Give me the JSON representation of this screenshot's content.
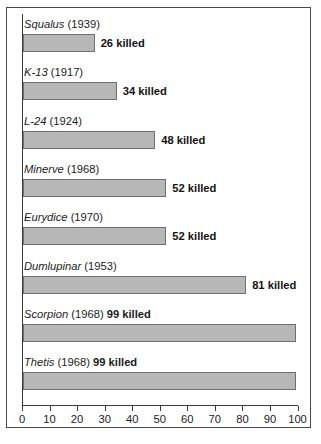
{
  "chart_data": {
    "type": "bar",
    "orientation": "horizontal",
    "title": "",
    "xlabel": "",
    "ylabel": "",
    "xlim": [
      0,
      100
    ],
    "grid": false,
    "legend": null,
    "value_suffix": "killed",
    "categories": [
      "Squalus (1939)",
      "K-13 (1917)",
      "L-24 (1924)",
      "Minerve (1968)",
      "Eurydice (1970)",
      "Dumlupinar (1953)",
      "Scorpion (1968)",
      "Thetis (1968)"
    ],
    "values": [
      26,
      34,
      48,
      52,
      52,
      81,
      99,
      99
    ],
    "items": [
      {
        "name": "Squalus",
        "year": "(1939)",
        "value": 26,
        "value_label": "26 killed",
        "label_inline": false
      },
      {
        "name": "K-13",
        "year": "(1917)",
        "value": 34,
        "value_label": "34 killed",
        "label_inline": false
      },
      {
        "name": "L-24",
        "year": "(1924)",
        "value": 48,
        "value_label": "48 killed",
        "label_inline": false
      },
      {
        "name": "Minerve",
        "year": "(1968)",
        "value": 52,
        "value_label": "52 killed",
        "label_inline": false
      },
      {
        "name": "Eurydice",
        "year": "(1970)",
        "value": 52,
        "value_label": "52 killed",
        "label_inline": false
      },
      {
        "name": "Dumlupinar",
        "year": "(1953)",
        "value": 81,
        "value_label": "81 killed",
        "label_inline": false
      },
      {
        "name": "Scorpion",
        "year": "(1968)",
        "value": 99,
        "value_label": "99 killed",
        "label_inline": true
      },
      {
        "name": "Thetis",
        "year": "(1968)",
        "value": 99,
        "value_label": "99 killed",
        "label_inline": true
      }
    ],
    "xticks": [
      0,
      10,
      20,
      30,
      40,
      50,
      60,
      70,
      80,
      90,
      100
    ],
    "xtick_labels": [
      "0",
      "10",
      "20",
      "30",
      "40",
      "50",
      "60",
      "70",
      "80",
      "90",
      "100"
    ],
    "colors": {
      "bar_fill": "#b7b7b7",
      "bar_stroke": "#6f6f6f",
      "axis": "#3b3b3b",
      "text": "#1b1b1b",
      "frame": "#4a4a4a",
      "background": "#ffffff"
    }
  }
}
